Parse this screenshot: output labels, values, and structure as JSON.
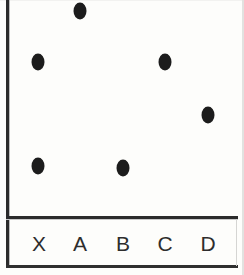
{
  "chart_data": {
    "type": "scatter",
    "title": "",
    "subtitle": "",
    "xlabel": "",
    "ylabel": "",
    "categories": [
      "X",
      "A",
      "B",
      "C",
      "D"
    ],
    "values": [
      {
        "category": "X",
        "value": 71
      },
      {
        "category": "A",
        "value": 95
      },
      {
        "category": "B",
        "value": 23
      },
      {
        "category": "C",
        "value": 71
      },
      {
        "category": "D",
        "value": 47
      }
    ],
    "extra_points": [
      {
        "category": "X",
        "value": 23
      }
    ],
    "point_pixel_positions": [
      {
        "label": "A",
        "x": 80,
        "y": 11
      },
      {
        "label": "X-high",
        "x": 38,
        "y": 62
      },
      {
        "label": "C",
        "x": 165,
        "y": 62
      },
      {
        "label": "D",
        "x": 208,
        "y": 115
      },
      {
        "label": "X-low",
        "x": 38,
        "y": 166
      },
      {
        "label": "B",
        "x": 123,
        "y": 168
      }
    ],
    "ylim": [
      0,
      100
    ],
    "grid": false,
    "legend": null,
    "marker_color": "#1c1c1c",
    "axis_color": "#2b2b2b",
    "background_color": "#fdfdfb"
  },
  "axis": {
    "labels": [
      {
        "text": "X",
        "x": 39
      },
      {
        "text": "A",
        "x": 80
      },
      {
        "text": "B",
        "x": 123
      },
      {
        "text": "C",
        "x": 165
      },
      {
        "text": "D",
        "x": 208
      }
    ]
  }
}
